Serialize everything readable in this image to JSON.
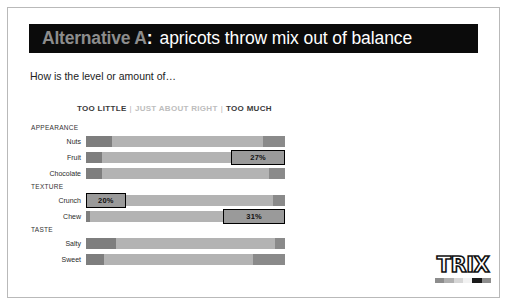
{
  "slide": {
    "title": {
      "prefix": "Alternative A",
      "colon": ":",
      "rest": "apricots throw mix out of balance"
    },
    "question": "How is the level or amount of…",
    "legend": {
      "too_little": "TOO LITTLE",
      "separator": "|",
      "just_right": "JUST ABOUT RIGHT",
      "too_much": "TOO MUCH"
    },
    "logo": {
      "word": "TRIX",
      "swatches": [
        "#8d8d8d",
        "#b0b0b0",
        "#d6d6d6",
        "#f2f2f2",
        "#1a1a1a",
        "#8d8d8d"
      ]
    }
  },
  "chart_data": {
    "type": "bar",
    "title": "How is the level or amount of…",
    "subtype": "100% stacked horizontal bar",
    "xlabel": "",
    "ylabel": "",
    "xlim": [
      0,
      100
    ],
    "grid": false,
    "legend_position": "top",
    "series": [
      {
        "name": "TOO LITTLE",
        "color": "#7e7e7e"
      },
      {
        "name": "JUST ABOUT RIGHT",
        "color": "#b3b3b3"
      },
      {
        "name": "TOO MUCH",
        "color": "#8a8a8a"
      }
    ],
    "sections": [
      {
        "label": "APPEARANCE",
        "rows": [
          {
            "label": "Nuts",
            "too_little": 13,
            "just_right": 76,
            "too_much": 11,
            "callout": null
          },
          {
            "label": "Fruit",
            "too_little": 8,
            "just_right": 65,
            "too_much": 27,
            "callout": {
              "side": "right",
              "value": "27%",
              "pct": 27
            }
          },
          {
            "label": "Chocolate",
            "too_little": 8,
            "just_right": 84,
            "too_much": 8,
            "callout": null
          }
        ]
      },
      {
        "label": "TEXTURE",
        "rows": [
          {
            "label": "Crunch",
            "too_little": 20,
            "just_right": 74,
            "too_much": 6,
            "callout": {
              "side": "left",
              "value": "20%",
              "pct": 20
            }
          },
          {
            "label": "Chew",
            "too_little": 2,
            "just_right": 67,
            "too_much": 31,
            "callout": {
              "side": "right",
              "value": "31%",
              "pct": 31
            }
          }
        ]
      },
      {
        "label": "TASTE",
        "rows": [
          {
            "label": "Salty",
            "too_little": 15,
            "just_right": 80,
            "too_much": 5,
            "callout": null
          },
          {
            "label": "Sweet",
            "too_little": 9,
            "just_right": 75,
            "too_much": 16,
            "callout": null
          }
        ]
      }
    ]
  }
}
